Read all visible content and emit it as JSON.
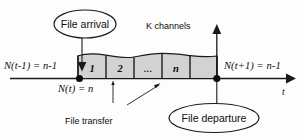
{
  "diagram": {
    "colors": {
      "stroke": "#1a1a1a",
      "box_fill": "#d2d2d2",
      "background": "#fdfdfd",
      "text": "#0d0d0d"
    },
    "callouts": {
      "arrival": "File arrival",
      "departure": "File departure"
    },
    "annotations": {
      "channels": "K channels",
      "file_transfer": "File transfer"
    },
    "state_labels": {
      "before": "N(t-1) = n-1",
      "current": "N(t) = n",
      "after": "N(t+1) = n-1"
    },
    "axis": {
      "label": "t"
    },
    "channels": [
      {
        "label": "1"
      },
      {
        "label": "2"
      },
      {
        "label": "..."
      },
      {
        "label": "n"
      },
      {
        "label": ""
      }
    ]
  }
}
